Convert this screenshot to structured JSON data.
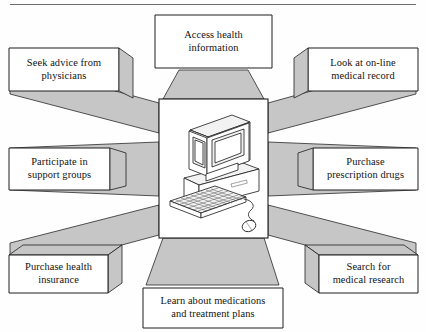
{
  "header": {
    "cut_off_text": "· · · · · · · · · · · · ·"
  },
  "diagram": {
    "center": {
      "icon": "desktop-computer-illustration",
      "description": "Desktop computer with monitor, CPU base, keyboard and mouse"
    },
    "colors": {
      "ray_fill": "#c6c6c6",
      "box_fill": "#ffffff",
      "outline": "#1e1e1e",
      "text": "#121212",
      "page_background": "#fefefe"
    },
    "nodes": [
      {
        "id": "access-health-information",
        "label": "Access health\ninformation",
        "position": "top"
      },
      {
        "id": "look-at-on-line-medical-record",
        "label": "Look at on-line\nmedical record",
        "position": "top-right"
      },
      {
        "id": "purchase-prescription-drugs",
        "label": "Purchase\nprescription drugs",
        "position": "right"
      },
      {
        "id": "search-for-medical-research",
        "label": "Search for\nmedical research",
        "position": "bottom-right"
      },
      {
        "id": "learn-about-medications",
        "label": "Learn about medications\nand treatment plans",
        "position": "bottom"
      },
      {
        "id": "purchase-health-insurance",
        "label": "Purchase health\ninsurance",
        "position": "bottom-left"
      },
      {
        "id": "participate-in-support-groups",
        "label": "Participate in\nsupport groups",
        "position": "left"
      },
      {
        "id": "seek-advice-from-physicians",
        "label": "Seek advice from\nphysicians",
        "position": "top-left"
      }
    ]
  }
}
